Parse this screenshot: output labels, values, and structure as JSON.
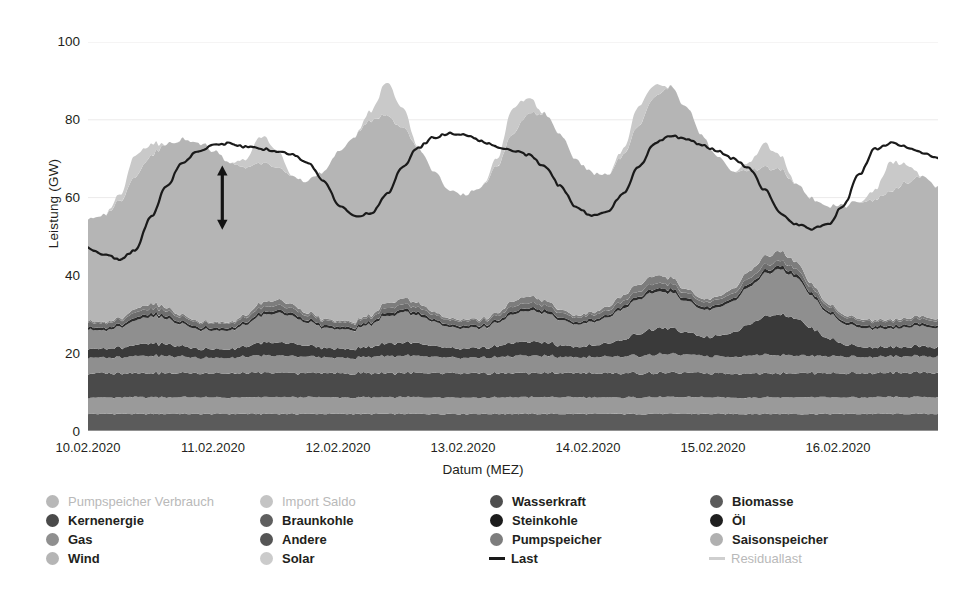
{
  "chart_data": {
    "type": "area",
    "title": "",
    "subtitle": "",
    "xlabel": "Datum (MEZ)",
    "ylabel": "Leistung (GW)",
    "ylim": [
      0,
      100
    ],
    "yticks": [
      0,
      20,
      40,
      60,
      80,
      100
    ],
    "xticks": [
      "10.02.2020",
      "11.02.2020",
      "12.02.2020",
      "13.02.2020",
      "14.02.2020",
      "15.02.2020",
      "16.02.2020"
    ],
    "x_range": [
      "10.02.2020",
      "16.02.2020 18:00"
    ],
    "grid": "horizontal-light",
    "legend_position": "bottom",
    "stacked": true,
    "annotation": {
      "type": "double-arrow",
      "orientation": "vertical",
      "x_pos_frac": 0.158,
      "y_top": 68,
      "y_bottom": 52
    },
    "x_hours": [
      0,
      3,
      6,
      9,
      12,
      15,
      18,
      21,
      24,
      27,
      30,
      33,
      36,
      39,
      42,
      45,
      48,
      51,
      54,
      57,
      60,
      63,
      66,
      69,
      72,
      75,
      78,
      81,
      84,
      87,
      90,
      93,
      96,
      99,
      102,
      105,
      108,
      111,
      114,
      117,
      120,
      123,
      126,
      129,
      132,
      135,
      138,
      141,
      144,
      147,
      150,
      153,
      156,
      159,
      162
    ],
    "series": [
      {
        "name": "Biomasse",
        "order": 1,
        "color": "#5b5b5b",
        "values": [
          4.4,
          4.4,
          4.4,
          4.4,
          4.4,
          4.4,
          4.4,
          4.4,
          4.4,
          4.4,
          4.4,
          4.4,
          4.4,
          4.4,
          4.4,
          4.4,
          4.4,
          4.4,
          4.4,
          4.4,
          4.4,
          4.4,
          4.4,
          4.4,
          4.4,
          4.4,
          4.4,
          4.4,
          4.4,
          4.4,
          4.4,
          4.4,
          4.4,
          4.4,
          4.4,
          4.4,
          4.4,
          4.4,
          4.4,
          4.4,
          4.4,
          4.4,
          4.4,
          4.4,
          4.4,
          4.4,
          4.4,
          4.4,
          4.4,
          4.4,
          4.4,
          4.4,
          4.4,
          4.4,
          4.4
        ]
      },
      {
        "name": "Wasserkraft",
        "order": 2,
        "color": "#9a9a9a",
        "values": [
          4.2,
          4.2,
          4.2,
          4.3,
          4.3,
          4.3,
          4.3,
          4.3,
          4.2,
          4.2,
          4.2,
          4.3,
          4.3,
          4.3,
          4.3,
          4.3,
          4.2,
          4.2,
          4.2,
          4.3,
          4.3,
          4.3,
          4.3,
          4.3,
          4.2,
          4.2,
          4.2,
          4.3,
          4.3,
          4.3,
          4.3,
          4.3,
          4.2,
          4.2,
          4.2,
          4.3,
          4.3,
          4.3,
          4.3,
          4.3,
          4.2,
          4.2,
          4.2,
          4.3,
          4.3,
          4.3,
          4.3,
          4.3,
          4.2,
          4.2,
          4.2,
          4.3,
          4.3,
          4.3,
          4.3
        ]
      },
      {
        "name": "Kernenergie",
        "order": 3,
        "color": "#4a4a4a",
        "values": [
          6.2,
          6.2,
          6.2,
          6.2,
          6.2,
          6.2,
          6.2,
          6.2,
          6.2,
          6.2,
          6.2,
          6.2,
          6.2,
          6.2,
          6.2,
          6.2,
          6.2,
          6.2,
          6.2,
          6.2,
          6.2,
          6.2,
          6.2,
          6.2,
          6.2,
          6.2,
          6.2,
          6.2,
          6.2,
          6.2,
          6.2,
          6.2,
          6.2,
          6.2,
          6.2,
          6.2,
          6.2,
          6.2,
          6.2,
          6.2,
          6.2,
          6.2,
          6.2,
          6.2,
          6.2,
          6.2,
          6.2,
          6.2,
          6.2,
          6.2,
          6.2,
          6.2,
          6.2,
          6.2,
          6.2
        ]
      },
      {
        "name": "Braunkohle",
        "order": 4,
        "color": "#8f8f8f",
        "values": [
          4.2,
          4.0,
          4.2,
          4.4,
          4.4,
          4.4,
          4.2,
          4.0,
          4.0,
          4.0,
          4.2,
          4.4,
          4.4,
          4.4,
          4.2,
          4.0,
          4.0,
          4.0,
          4.2,
          4.4,
          4.4,
          4.4,
          4.2,
          4.0,
          4.0,
          4.0,
          4.2,
          4.4,
          4.4,
          4.4,
          4.2,
          4.0,
          4.2,
          4.2,
          4.4,
          4.6,
          4.8,
          4.8,
          4.6,
          4.4,
          4.4,
          4.4,
          4.6,
          4.8,
          4.8,
          4.6,
          4.4,
          4.4,
          4.4,
          4.2,
          4.2,
          4.2,
          4.2,
          4.2,
          4.2
        ]
      },
      {
        "name": "Steinkohle",
        "order": 5,
        "color": "#3a3a3a",
        "values": [
          2.3,
          2.2,
          2.4,
          2.8,
          3.2,
          3.0,
          2.6,
          2.3,
          2.2,
          2.2,
          2.6,
          3.2,
          3.4,
          3.2,
          2.8,
          2.4,
          2.3,
          2.3,
          2.6,
          3.2,
          3.4,
          3.2,
          2.8,
          2.4,
          2.4,
          2.4,
          2.8,
          3.4,
          3.6,
          3.4,
          3.0,
          2.6,
          3.0,
          3.4,
          4.2,
          5.6,
          6.6,
          6.6,
          5.8,
          4.8,
          5.2,
          6.2,
          8.0,
          9.6,
          10.4,
          9.4,
          7.0,
          4.6,
          3.2,
          2.6,
          2.4,
          2.3,
          2.4,
          2.6,
          2.4
        ]
      },
      {
        "name": "Gas",
        "order": 6,
        "color": "#8f8f8f",
        "values": [
          5.0,
          4.8,
          5.2,
          6.2,
          7.0,
          6.6,
          5.6,
          5.0,
          4.8,
          4.8,
          5.6,
          7.0,
          7.6,
          7.0,
          6.0,
          5.2,
          5.0,
          5.0,
          5.8,
          7.2,
          7.8,
          7.2,
          6.2,
          5.4,
          5.2,
          5.2,
          6.0,
          7.4,
          8.0,
          7.6,
          6.6,
          5.8,
          6.0,
          6.8,
          8.0,
          9.0,
          9.6,
          9.2,
          8.0,
          7.0,
          7.2,
          8.0,
          9.6,
          11.0,
          11.6,
          10.6,
          8.4,
          6.4,
          5.4,
          5.0,
          4.8,
          4.8,
          5.0,
          5.2,
          5.0
        ]
      },
      {
        "name": "Öl",
        "order": 7,
        "color": "#2b2b2b",
        "values": [
          0.6,
          0.6,
          0.6,
          0.7,
          0.7,
          0.7,
          0.6,
          0.6,
          0.6,
          0.6,
          0.6,
          0.7,
          0.7,
          0.7,
          0.6,
          0.6,
          0.6,
          0.6,
          0.6,
          0.7,
          0.7,
          0.7,
          0.6,
          0.6,
          0.6,
          0.6,
          0.6,
          0.7,
          0.7,
          0.7,
          0.6,
          0.6,
          0.6,
          0.6,
          0.7,
          0.7,
          0.8,
          0.8,
          0.7,
          0.7,
          0.7,
          0.7,
          0.8,
          0.8,
          0.8,
          0.8,
          0.7,
          0.6,
          0.6,
          0.6,
          0.6,
          0.6,
          0.6,
          0.6,
          0.6
        ]
      },
      {
        "name": "Andere",
        "order": 8,
        "color": "#6e6e6e",
        "values": [
          1.2,
          1.2,
          1.2,
          1.3,
          1.3,
          1.3,
          1.2,
          1.2,
          1.2,
          1.2,
          1.2,
          1.3,
          1.3,
          1.3,
          1.2,
          1.2,
          1.2,
          1.2,
          1.2,
          1.3,
          1.3,
          1.3,
          1.2,
          1.2,
          1.2,
          1.2,
          1.2,
          1.3,
          1.3,
          1.3,
          1.2,
          1.2,
          1.2,
          1.2,
          1.3,
          1.3,
          1.4,
          1.4,
          1.3,
          1.3,
          1.3,
          1.3,
          1.4,
          1.4,
          1.4,
          1.4,
          1.3,
          1.2,
          1.2,
          1.2,
          1.2,
          1.2,
          1.2,
          1.2,
          1.2
        ]
      },
      {
        "name": "Pumpspeicher",
        "order": 9,
        "color": "#7d7d7d",
        "values": [
          0.4,
          0.3,
          0.4,
          0.9,
          1.2,
          0.8,
          0.5,
          0.3,
          0.3,
          0.3,
          0.6,
          1.2,
          1.4,
          1.0,
          0.6,
          0.4,
          0.3,
          0.3,
          0.6,
          1.3,
          1.5,
          1.1,
          0.7,
          0.4,
          0.4,
          0.4,
          0.7,
          1.4,
          1.6,
          1.2,
          0.8,
          0.5,
          0.6,
          0.9,
          1.4,
          1.8,
          2.0,
          1.6,
          1.0,
          0.7,
          0.8,
          1.2,
          1.8,
          2.2,
          2.4,
          1.8,
          1.0,
          0.6,
          0.5,
          0.4,
          0.4,
          0.4,
          0.5,
          0.6,
          0.5
        ]
      },
      {
        "name": "Wind",
        "order": 10,
        "color": "#b5b5b5",
        "values": [
          26.0,
          27.5,
          30.0,
          34.0,
          38.0,
          42.0,
          45.0,
          46.0,
          44.0,
          41.0,
          38.0,
          36.0,
          34.0,
          33.0,
          34.0,
          38.0,
          44.0,
          48.0,
          50.0,
          48.0,
          44.0,
          40.0,
          36.0,
          33.0,
          32.0,
          34.0,
          38.0,
          43.0,
          47.0,
          48.0,
          45.0,
          40.0,
          36.0,
          34.0,
          36.0,
          41.0,
          46.0,
          49.0,
          47.0,
          42.0,
          36.0,
          30.0,
          26.0,
          23.0,
          21.0,
          20.0,
          22.0,
          25.0,
          28.0,
          30.0,
          31.0,
          33.0,
          35.0,
          36.0,
          34.0
        ]
      },
      {
        "name": "Solar",
        "order": 11,
        "color": "#c9c9c9",
        "values": [
          0.0,
          0.0,
          1.5,
          5.5,
          3.0,
          0.0,
          0.0,
          0.0,
          0.0,
          0.0,
          2.0,
          7.0,
          4.5,
          0.0,
          0.0,
          0.0,
          0.0,
          0.0,
          2.5,
          8.5,
          5.0,
          0.0,
          0.0,
          0.0,
          0.0,
          0.0,
          2.0,
          6.5,
          4.0,
          0.0,
          0.0,
          0.0,
          0.0,
          0.0,
          1.5,
          5.0,
          3.0,
          0.0,
          0.0,
          0.0,
          0.0,
          0.0,
          2.0,
          6.0,
          3.5,
          0.0,
          0.0,
          0.0,
          0.0,
          0.0,
          2.5,
          7.5,
          4.5,
          0.0,
          0.0
        ]
      }
    ],
    "lines": [
      {
        "name": "Last",
        "color": "#1a1a1a",
        "width": 2.2,
        "values": [
          47.0,
          45.5,
          44.0,
          46.5,
          55.0,
          63.0,
          69.0,
          72.0,
          73.5,
          74.0,
          73.0,
          72.5,
          72.0,
          71.0,
          69.0,
          64.0,
          58.0,
          55.0,
          56.0,
          61.0,
          68.0,
          73.0,
          75.5,
          76.5,
          76.0,
          74.5,
          73.0,
          72.0,
          71.0,
          68.0,
          63.0,
          57.5,
          55.5,
          56.5,
          61.0,
          68.0,
          74.0,
          76.0,
          75.0,
          73.5,
          72.0,
          70.0,
          67.5,
          62.0,
          56.0,
          53.0,
          52.0,
          53.0,
          58.0,
          66.0,
          72.5,
          74.0,
          73.0,
          71.5,
          70.0
        ]
      },
      {
        "name": "Residuallast",
        "color": "#d2d2d2",
        "width": 1.6,
        "visible": false,
        "values": []
      }
    ]
  },
  "legend": {
    "columns": [
      {
        "x": 6,
        "items": [
          {
            "label": "Pumpspeicher Verbrauch",
            "marker": "dot",
            "color": "#b8b8b8",
            "active": false
          },
          {
            "label": "Kernenergie",
            "marker": "dot",
            "color": "#4a4a4a",
            "active": true
          },
          {
            "label": "Gas",
            "marker": "dot",
            "color": "#8f8f8f",
            "active": true
          },
          {
            "label": "Wind",
            "marker": "dot",
            "color": "#b5b5b5",
            "active": true
          }
        ]
      },
      {
        "x": 220,
        "items": [
          {
            "label": "Import Saldo",
            "marker": "dot",
            "color": "#c4c4c4",
            "active": false
          },
          {
            "label": "Braunkohle",
            "marker": "dot",
            "color": "#5f5f5f",
            "active": true
          },
          {
            "label": "Andere",
            "marker": "dot",
            "color": "#555555",
            "active": true
          },
          {
            "label": "Solar",
            "marker": "dot",
            "color": "#cbcbcb",
            "active": true
          }
        ]
      },
      {
        "x": 450,
        "items": [
          {
            "label": "Wasserkraft",
            "marker": "dot",
            "color": "#4f4f4f",
            "active": true
          },
          {
            "label": "Steinkohle",
            "marker": "dot",
            "color": "#1c1c1c",
            "active": true
          },
          {
            "label": "Pumpspeicher",
            "marker": "dot",
            "color": "#7d7d7d",
            "active": true
          },
          {
            "label": "Last",
            "marker": "line",
            "color": "#1a1a1a",
            "active": true
          }
        ]
      },
      {
        "x": 670,
        "items": [
          {
            "label": "Biomasse",
            "marker": "dot",
            "color": "#5b5b5b",
            "active": true
          },
          {
            "label": "Öl",
            "marker": "dot",
            "color": "#1f1f1f",
            "active": true
          },
          {
            "label": "Saisonspeicher",
            "marker": "dot",
            "color": "#b0b0b0",
            "active": true
          },
          {
            "label": "Residuallast",
            "marker": "line",
            "color": "#cfcfcf",
            "active": false
          }
        ]
      }
    ]
  },
  "colors": {
    "background": "#ffffff",
    "axis_text": "#231f20",
    "gridline": "#eceaea",
    "plot_border": "#c8c8c8",
    "annotation_arrow": "#141414"
  }
}
